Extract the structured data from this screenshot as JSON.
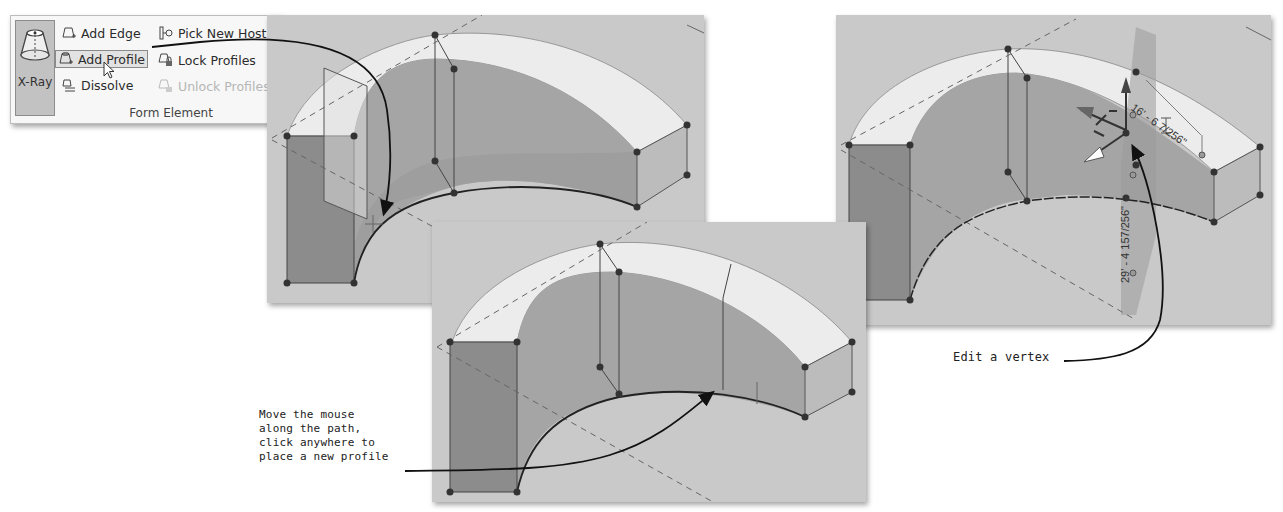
{
  "ribbon": {
    "xray_label": "X-Ray",
    "items": [
      {
        "label": "Add  Edge",
        "icon": "add-edge-icon",
        "state": "normal"
      },
      {
        "label": "Pick  New Host",
        "icon": "pick-new-host-icon",
        "state": "normal"
      },
      {
        "label": "Add  Profile",
        "icon": "add-profile-icon",
        "state": "hover"
      },
      {
        "label": "Lock  Profiles",
        "icon": "lock-profiles-icon",
        "state": "normal"
      },
      {
        "label": "Dissolve",
        "icon": "dissolve-icon",
        "state": "normal"
      },
      {
        "label": "Unlock  Profiles",
        "icon": "unlock-profiles-icon",
        "state": "disabled"
      }
    ],
    "group_label": "Form Element"
  },
  "callouts": {
    "move_mouse": [
      "Move the mouse",
      "along the path,",
      "click anywhere to",
      "place a new profile"
    ],
    "edit_vertex": "Edit a vertex"
  },
  "dimensions": {
    "horizontal": "16' - 6 7/256\"",
    "vertical": "29' - 4 157/256\""
  },
  "colors": {
    "panel_bg": "#c9c9c9",
    "top_face": "#ececec",
    "side_face": "#9a9a9a",
    "profile_face": "#8c8c8c",
    "vertex": "#333333",
    "arrow": "#111111"
  }
}
